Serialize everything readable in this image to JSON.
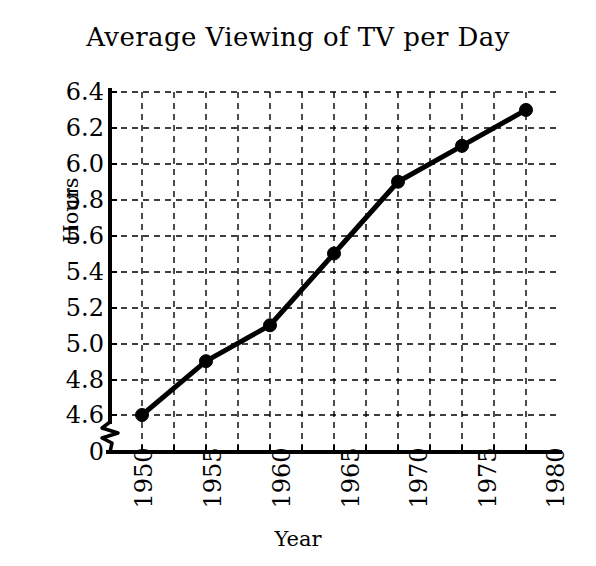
{
  "chart_data": {
    "type": "line",
    "title": "Average Viewing of TV per Day",
    "xlabel": "Year",
    "ylabel": "Hours",
    "x": [
      1950,
      1955,
      1960,
      1965,
      1970,
      1975,
      1980
    ],
    "values": [
      4.6,
      4.9,
      5.1,
      5.5,
      5.9,
      6.1,
      6.3
    ],
    "series": [
      {
        "name": "Average Viewing of TV per Day",
        "values": [
          4.6,
          4.9,
          5.1,
          5.5,
          5.9,
          6.1,
          6.3
        ]
      }
    ],
    "categories": [
      "1950",
      "1955",
      "1960",
      "1965",
      "1970",
      "1975",
      "1980"
    ],
    "xtick_labels": [
      "1950",
      "1955",
      "1960",
      "1965",
      "1970",
      "1975",
      "1980"
    ],
    "ytick_labels": [
      "6.4",
      "6.2",
      "6.0",
      "5.8",
      "5.6",
      "5.4",
      "5.2",
      "5.0",
      "4.8",
      "4.6",
      "0"
    ],
    "ylim": [
      4.5,
      6.4
    ],
    "xlim": [
      1947.5,
      1982.5
    ],
    "y_axis_break": true,
    "y_axis_break_label": "0",
    "grid": true,
    "grid_style": "dashed",
    "legend": "none",
    "line_color": "#000000",
    "marker": "circle",
    "marker_color": "#000000",
    "background_color": "#ffffff",
    "annotations": []
  },
  "ytick_positions": [
    92,
    128,
    164,
    200,
    236,
    272,
    308,
    344,
    380,
    415,
    452
  ],
  "xtick_positions": [
    146,
    215,
    284,
    353,
    421,
    490,
    558
  ]
}
